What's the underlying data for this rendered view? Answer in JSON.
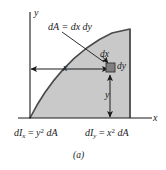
{
  "figure": {
    "caption": "(a)",
    "axes": {
      "y_label": "y",
      "x_label": "x"
    },
    "region": {
      "fill_color": "#c9c9c9",
      "edge_color": "#4a4a4a",
      "shape": "quarter-circle-concave"
    },
    "element": {
      "fill_color": "#808080",
      "edge_color": "#333333",
      "area_label": "dA = dx dy",
      "width_label": "dx",
      "height_label": "dy"
    },
    "dimensions": {
      "horizontal_label": "x",
      "vertical_label": "y"
    },
    "equations": {
      "moment_x": {
        "lhs_d": "d",
        "lhs_I": "I",
        "lhs_sub": "x",
        "eq": "=",
        "var": "y",
        "exp": "2",
        "rhs": "dA"
      },
      "moment_y": {
        "lhs_d": "d",
        "lhs_I": "I",
        "lhs_sub": "y",
        "eq": "=",
        "var": "x",
        "exp": "2",
        "rhs": "dA"
      }
    }
  }
}
